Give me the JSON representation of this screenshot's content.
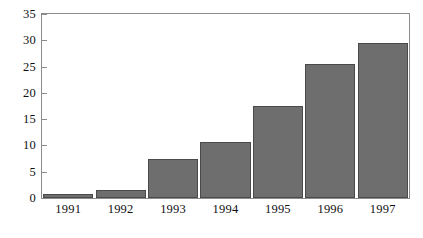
{
  "chart_data": {
    "type": "bar",
    "title": "",
    "subtitle": "",
    "xlabel": "",
    "ylabel": "",
    "categories": [
      "1991",
      "1992",
      "1993",
      "1994",
      "1995",
      "1996",
      "1997"
    ],
    "values": [
      0.8,
      1.6,
      7.5,
      10.6,
      17.5,
      25.5,
      29.4
    ],
    "series": [
      {
        "name": "",
        "values": [
          0.8,
          1.6,
          7.5,
          10.6,
          17.5,
          25.5,
          29.4
        ]
      }
    ],
    "ylim": [
      0,
      35
    ],
    "yticks": [
      0,
      5,
      10,
      15,
      20,
      25,
      30,
      35
    ],
    "ytick_labels": [
      "0",
      "5",
      "10",
      "15",
      "20",
      "25",
      "30",
      "35"
    ],
    "grid": false,
    "legend": null,
    "legend_position": "none",
    "annotations": [],
    "bar_color": "#6e6e6e",
    "bar_edge_color": "#4a4a4a",
    "frame_color": "#8c8c8c",
    "background_color": "#ffffff",
    "text_color": "#111111"
  }
}
